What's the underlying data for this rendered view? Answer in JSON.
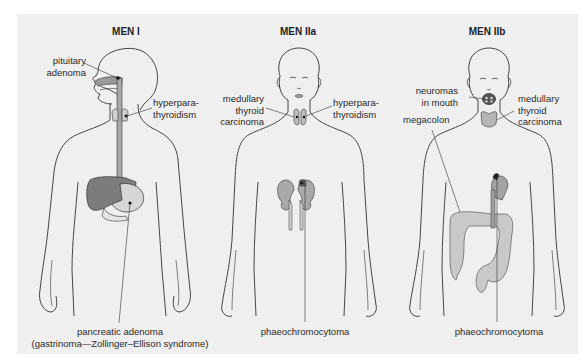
{
  "figure": {
    "background": "#efefef",
    "colors": {
      "outline": "#333333",
      "organ_dark": "#7a7a7a",
      "organ_light": "#b8b8b8",
      "organ_pale": "#d4d4d4",
      "lesion": "#111111"
    },
    "panels": [
      {
        "title": "MEN I",
        "labels": {
          "pituitary": "pituitary adenoma",
          "pituitary_l1": "pituitary",
          "pituitary_l2": "adenoma",
          "parathyroid_l1": "hyperpara-",
          "parathyroid_l2": "thyroidism",
          "pancreas_l1": "pancreatic adenoma",
          "pancreas_l2": "(gastrinoma—Zollinger–Ellison syndrome)"
        }
      },
      {
        "title": "MEN IIa",
        "labels": {
          "mtc_l1": "medullary",
          "mtc_l2": "thyroid",
          "mtc_l3": "carcinoma",
          "parathyroid_l1": "hyperpara-",
          "parathyroid_l2": "thyroidism",
          "pheo": "phaeochromocytoma"
        }
      },
      {
        "title": "MEN IIb",
        "labels": {
          "neuromas_l1": "neuromas",
          "neuromas_l2": "in mouth",
          "megacolon": "megacolon",
          "mtc_l1": "medullary",
          "mtc_l2": "thyroid",
          "mtc_l3": "carcinoma",
          "pheo": "phaeochromocytoma"
        }
      }
    ]
  }
}
